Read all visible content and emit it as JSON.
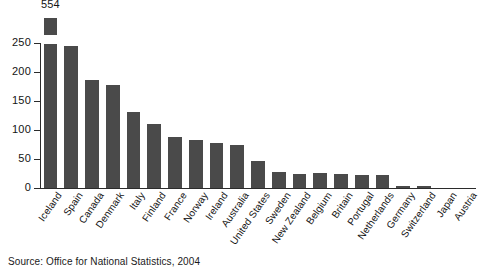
{
  "chart_data": {
    "type": "bar",
    "title": "",
    "subtitle": "",
    "xlabel": "",
    "ylabel": "",
    "ylim": [
      0,
      250
    ],
    "grid": false,
    "legend": false,
    "axis_note": "y-axis truncated at 250; first bar broken with zigzag cap",
    "yticks": [
      0,
      50,
      100,
      150,
      200,
      250
    ],
    "ytick_labels": [
      "0",
      "50",
      "100",
      "150",
      "200",
      "250"
    ],
    "categories": [
      "Iceland",
      "Spain",
      "Canada",
      "Denmark",
      "Italy",
      "Finland",
      "France",
      "Norway",
      "Ireland",
      "Australia",
      "United States",
      "Sweden",
      "New Zealand",
      "Belgium",
      "Britain",
      "Portugal",
      "Netherlands",
      "Germany",
      "Switzerland",
      "Japan",
      "Austria"
    ],
    "values": [
      554,
      245,
      186,
      177,
      131,
      110,
      88,
      83,
      78,
      75,
      46,
      28,
      25,
      26,
      25,
      23,
      22,
      4,
      3,
      0,
      0
    ],
    "data_labels": [
      "554",
      "",
      "",
      "",
      "",
      "",
      "",
      "",
      "",
      "",
      "",
      "",
      "",
      "",
      "",
      "",
      "",
      "",
      "",
      "",
      ""
    ],
    "broken_bars": [
      true,
      false,
      false,
      false,
      false,
      false,
      false,
      false,
      false,
      false,
      false,
      false,
      false,
      false,
      false,
      false,
      false,
      false,
      false,
      false,
      false
    ],
    "bar_color": "#4a4a4a",
    "axis_color": "#2b2b2b",
    "background_color": "#ffffff"
  },
  "source": {
    "text": "Source: Office for National Statistics, 2004"
  }
}
